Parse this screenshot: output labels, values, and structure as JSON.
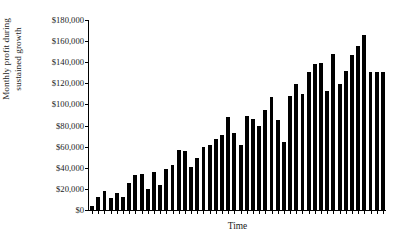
{
  "chart_data": {
    "type": "bar",
    "title": "",
    "subtitle": "",
    "xlabel": "Time",
    "ylabel": "Monthly profit during sustained growth",
    "ylabel_line1": "Monthly profit during",
    "ylabel_line2": "sustained growth",
    "ylim": [
      0,
      180000
    ],
    "ytick_values": [
      0,
      20000,
      40000,
      60000,
      80000,
      100000,
      120000,
      140000,
      160000,
      180000
    ],
    "ytick_labels": [
      "$0",
      "$20,000",
      "$40,000",
      "$60,000",
      "$80,000",
      "$100,000",
      "$120,000",
      "$140,000",
      "$160,000",
      "$180,000"
    ],
    "xtick_labels": [],
    "grid": false,
    "legend": null,
    "bar_color": "#000000",
    "axis_color": "#000000",
    "background": "#ffffff",
    "n_bars": 48,
    "categories": [
      "1",
      "2",
      "3",
      "4",
      "5",
      "6",
      "7",
      "8",
      "9",
      "10",
      "11",
      "12",
      "13",
      "14",
      "15",
      "16",
      "17",
      "18",
      "19",
      "20",
      "21",
      "22",
      "23",
      "24",
      "25",
      "26",
      "27",
      "28",
      "29",
      "30",
      "31",
      "32",
      "33",
      "34",
      "35",
      "36",
      "37",
      "38",
      "39",
      "40",
      "41",
      "42",
      "43",
      "44",
      "45",
      "46",
      "47",
      "48"
    ],
    "values": [
      4000,
      12000,
      18000,
      11000,
      16000,
      12000,
      26000,
      33000,
      34000,
      20000,
      36000,
      24000,
      39000,
      43000,
      57000,
      56000,
      41000,
      49000,
      60000,
      62000,
      67000,
      71000,
      88000,
      73000,
      62000,
      89000,
      86000,
      80000,
      95000,
      107000,
      85000,
      64000,
      108000,
      119000,
      110000,
      131000,
      138000,
      139000,
      113000,
      148000,
      119000,
      132000,
      147000,
      155000,
      166000,
      131000,
      131000,
      131000
    ]
  }
}
